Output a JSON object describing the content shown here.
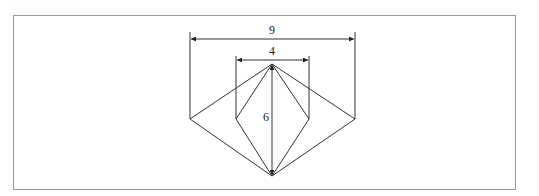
{
  "figure": {
    "header_fragment": "··· ··· ··· ···· ···",
    "labels": {
      "outer_width": "9",
      "inner_width": "4",
      "height": "6"
    },
    "colors": {
      "frame": "#9a9a9a",
      "lines": "#333333",
      "text": "#222222"
    }
  }
}
